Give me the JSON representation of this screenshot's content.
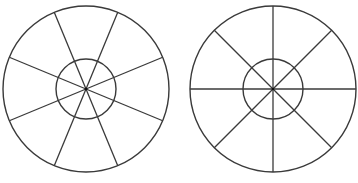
{
  "diagram": {
    "stroke_color": "#3a3a3a",
    "background": "#ffffff",
    "figures": [
      {
        "name": "left-wheel",
        "center": [
          86,
          89
        ],
        "outer_radius": 83,
        "inner_radius": 30,
        "spokes": 8,
        "rotation_deg": 22.5
      },
      {
        "name": "right-wheel",
        "center": [
          273,
          89
        ],
        "outer_radius": 83,
        "inner_radius": 30,
        "spokes": 8,
        "rotation_deg": 0
      }
    ]
  }
}
